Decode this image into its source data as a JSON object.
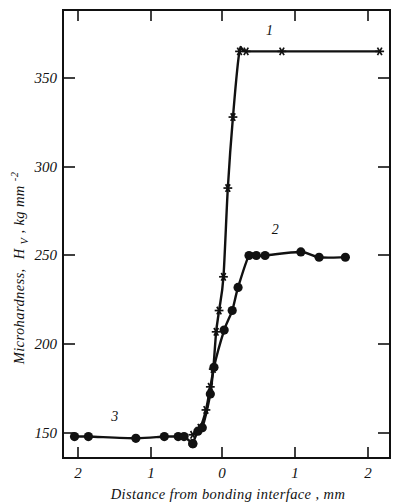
{
  "figure": {
    "background_color": "#ffffff",
    "ink_color": "#111111"
  },
  "chart_data": {
    "type": "line",
    "title": "",
    "subtitle": "",
    "xlabel": "Distance from bonding interface , mm",
    "ylabel": "Microhardness, H_V , kg mm^-2",
    "ylabel_parts": {
      "main": "Microhardness,",
      "symbol": "H",
      "subscript": "V",
      "units_prefix": ", kg mm",
      "superscript": "-2"
    },
    "xlim": [
      -2.2,
      2.3
    ],
    "ylim": [
      130,
      380
    ],
    "xticks": [
      -2,
      -1,
      0,
      1,
      2
    ],
    "xtick_labels": [
      "2",
      "1",
      "0",
      "1",
      "2"
    ],
    "yticks": [
      150,
      200,
      250,
      300,
      350
    ],
    "ytick_labels": [
      "150",
      "200",
      "250",
      "300",
      "350"
    ],
    "grid": false,
    "legend_position": "inline-annotations",
    "annotations": [
      {
        "text": "1",
        "x": 0.65,
        "y": 374,
        "series": "1"
      },
      {
        "text": "2",
        "x": 0.73,
        "y": 262,
        "series": "2"
      },
      {
        "text": "3",
        "x": -1.47,
        "y": 157,
        "series": "3"
      }
    ],
    "series": [
      {
        "name": "1",
        "label": "1",
        "marker": "star",
        "points": [
          {
            "x": -0.4,
            "y": 149
          },
          {
            "x": -0.3,
            "y": 153
          },
          {
            "x": -0.22,
            "y": 163
          },
          {
            "x": -0.16,
            "y": 176
          },
          {
            "x": -0.12,
            "y": 186
          },
          {
            "x": -0.08,
            "y": 207
          },
          {
            "x": -0.04,
            "y": 219
          },
          {
            "x": 0.02,
            "y": 238
          },
          {
            "x": 0.08,
            "y": 288
          },
          {
            "x": 0.15,
            "y": 328
          },
          {
            "x": 0.24,
            "y": 365
          },
          {
            "x": 0.33,
            "y": 365
          },
          {
            "x": 0.82,
            "y": 365
          },
          {
            "x": 2.16,
            "y": 365
          }
        ]
      },
      {
        "name": "2",
        "label": "2",
        "marker": "circle",
        "points": [
          {
            "x": -0.4,
            "y": 144
          },
          {
            "x": -0.33,
            "y": 151
          },
          {
            "x": -0.27,
            "y": 153
          },
          {
            "x": -0.16,
            "y": 172
          },
          {
            "x": -0.11,
            "y": 187
          },
          {
            "x": 0.03,
            "y": 208
          },
          {
            "x": 0.14,
            "y": 219
          },
          {
            "x": 0.22,
            "y": 232
          },
          {
            "x": 0.37,
            "y": 250
          },
          {
            "x": 0.47,
            "y": 250
          },
          {
            "x": 0.59,
            "y": 250
          },
          {
            "x": 1.08,
            "y": 252
          },
          {
            "x": 1.33,
            "y": 249
          },
          {
            "x": 1.69,
            "y": 249
          }
        ]
      },
      {
        "name": "3",
        "label": "3",
        "marker": "circle",
        "points": [
          {
            "x": -2.02,
            "y": 148
          },
          {
            "x": -1.83,
            "y": 148
          },
          {
            "x": -1.18,
            "y": 147
          },
          {
            "x": -0.79,
            "y": 148
          },
          {
            "x": -0.6,
            "y": 148
          },
          {
            "x": -0.52,
            "y": 148
          },
          {
            "x": -0.4,
            "y": 144
          }
        ]
      }
    ]
  }
}
